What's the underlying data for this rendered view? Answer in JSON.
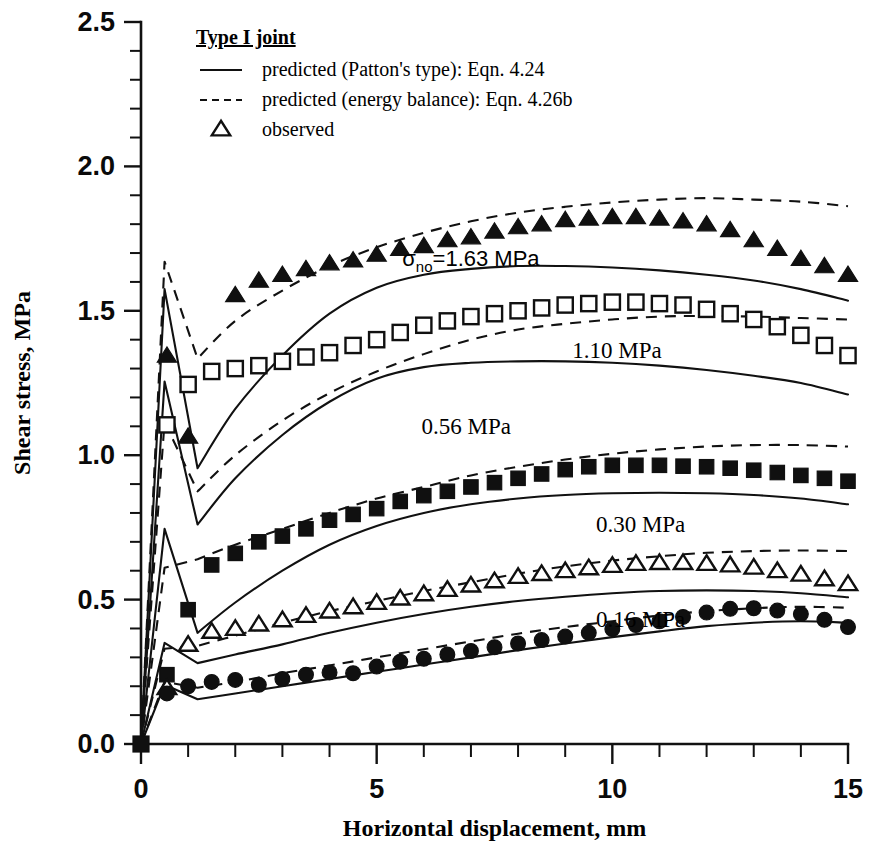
{
  "chart_data": {
    "type": "line",
    "title": "",
    "xlabel": "Horizontal displacement, mm",
    "ylabel": "Shear stress, MPa",
    "xlim": [
      0,
      15
    ],
    "ylim": [
      0.0,
      2.5
    ],
    "grid": false,
    "xticks": [
      0,
      5,
      10,
      15
    ],
    "xticklabels": [
      "0",
      "5",
      "10",
      "15"
    ],
    "xminor_step": 1,
    "yticks": [
      0.0,
      0.5,
      1.0,
      1.5,
      2.0,
      2.5
    ],
    "yticklabels": [
      "0.0",
      "0.5",
      "1.0",
      "1.5",
      "2.0",
      "2.5"
    ],
    "yminor_step": 0.1,
    "legend": {
      "position": "top-left-inside",
      "title": "Type I joint",
      "entries": [
        {
          "marker": "line-solid",
          "label": "predicted (Patton's type): Eqn. 4.24"
        },
        {
          "marker": "line-dashed",
          "label": "predicted (energy balance): Eqn. 4.26b"
        },
        {
          "marker": "triangle-open",
          "label": "observed"
        }
      ]
    },
    "annotations": [
      {
        "text": "σno=1.63 MPa",
        "sigma": "σ",
        "subscript": "no",
        "rest": "=1.63 MPa",
        "x": 7.0,
        "y": 1.655,
        "font": "sans"
      },
      {
        "text": "1.10 MPa",
        "x": 10.1,
        "y": 1.335,
        "font": "serif"
      },
      {
        "text": "0.56 MPa",
        "x": 6.9,
        "y": 1.075,
        "font": "serif"
      },
      {
        "text": "0.30 MPa",
        "x": 10.6,
        "y": 0.735,
        "font": "serif"
      },
      {
        "text": "0.16 MPa",
        "x": 10.6,
        "y": 0.405,
        "font": "serif"
      }
    ],
    "series": [
      {
        "name": "1.63 MPa",
        "normal_stress": 1.63,
        "marker": "triangle-filled",
        "observed": {
          "x": [
            2.0,
            2.5,
            3.0,
            3.5,
            4.0,
            4.5,
            5.0,
            5.5,
            6.0,
            6.5,
            7.0,
            7.5,
            8.0,
            8.5,
            9.0,
            9.5,
            10.0,
            10.5,
            11.0,
            11.5,
            12.0,
            12.5,
            13.0,
            13.5,
            14.0,
            14.5,
            15.0
          ],
          "y": [
            1.555,
            1.605,
            1.625,
            1.645,
            1.665,
            1.675,
            1.695,
            1.715,
            1.725,
            1.745,
            1.755,
            1.775,
            1.79,
            1.8,
            1.815,
            1.82,
            1.825,
            1.825,
            1.82,
            1.81,
            1.8,
            1.78,
            1.745,
            1.715,
            1.68,
            1.655,
            1.625
          ]
        },
        "extra_observed": {
          "x": [
            0.55,
            1.0
          ],
          "y": [
            1.345,
            1.065
          ]
        },
        "predicted_patton": {
          "x": [
            0.0,
            0.5,
            1.2,
            2.0,
            3.0,
            4.0,
            5.0,
            6.0,
            7.0,
            8.0,
            9.0,
            10.0,
            11.0,
            12.0,
            13.0,
            14.0,
            15.0
          ],
          "y": [
            0.0,
            1.575,
            0.955,
            1.16,
            1.345,
            1.49,
            1.58,
            1.625,
            1.645,
            1.655,
            1.655,
            1.65,
            1.64,
            1.625,
            1.605,
            1.575,
            1.535
          ]
        },
        "predicted_energy": {
          "x": [
            0.0,
            0.5,
            1.2,
            2.0,
            3.0,
            4.0,
            5.0,
            6.0,
            7.0,
            8.0,
            9.0,
            10.0,
            11.0,
            12.0,
            13.0,
            14.0,
            15.0
          ],
          "y": [
            0.0,
            1.67,
            1.335,
            1.465,
            1.57,
            1.655,
            1.72,
            1.77,
            1.81,
            1.84,
            1.86,
            1.875,
            1.885,
            1.89,
            1.885,
            1.878,
            1.862
          ]
        }
      },
      {
        "name": "1.10 MPa",
        "normal_stress": 1.1,
        "marker": "square-open",
        "observed": {
          "x": [
            0.55,
            1.0,
            1.5,
            2.0,
            2.5,
            3.0,
            3.5,
            4.0,
            4.5,
            5.0,
            5.5,
            6.0,
            6.5,
            7.0,
            7.5,
            8.0,
            8.5,
            9.0,
            9.5,
            10.0,
            10.5,
            11.0,
            11.5,
            12.0,
            12.5,
            13.0,
            13.5,
            14.0,
            14.5,
            15.0
          ],
          "y": [
            1.105,
            1.245,
            1.29,
            1.3,
            1.31,
            1.325,
            1.34,
            1.355,
            1.38,
            1.4,
            1.425,
            1.45,
            1.465,
            1.48,
            1.49,
            1.5,
            1.51,
            1.52,
            1.525,
            1.53,
            1.53,
            1.525,
            1.52,
            1.505,
            1.49,
            1.47,
            1.445,
            1.415,
            1.38,
            1.345
          ]
        },
        "predicted_patton": {
          "x": [
            0.0,
            0.5,
            1.2,
            2.0,
            3.0,
            4.0,
            5.0,
            6.0,
            7.0,
            8.0,
            9.0,
            10.0,
            11.0,
            12.0,
            13.0,
            14.0,
            15.0
          ],
          "y": [
            0.0,
            1.255,
            0.76,
            0.92,
            1.07,
            1.185,
            1.265,
            1.305,
            1.32,
            1.325,
            1.325,
            1.32,
            1.31,
            1.295,
            1.275,
            1.25,
            1.21
          ]
        },
        "predicted_energy": {
          "x": [
            0.0,
            0.5,
            1.2,
            2.0,
            3.0,
            4.0,
            5.0,
            6.0,
            7.0,
            8.0,
            9.0,
            10.0,
            11.0,
            12.0,
            13.0,
            14.0,
            15.0
          ],
          "y": [
            0.0,
            1.115,
            0.875,
            1.0,
            1.12,
            1.215,
            1.29,
            1.35,
            1.4,
            1.435,
            1.455,
            1.47,
            1.48,
            1.482,
            1.48,
            1.475,
            1.47
          ]
        }
      },
      {
        "name": "0.56 MPa",
        "normal_stress": 0.56,
        "marker": "square-filled",
        "observed": {
          "x": [
            0.55,
            1.0,
            1.5,
            2.0,
            2.5,
            3.0,
            3.5,
            4.0,
            4.5,
            5.0,
            5.5,
            6.0,
            6.5,
            7.0,
            7.5,
            8.0,
            8.5,
            9.0,
            9.5,
            10.0,
            10.5,
            11.0,
            11.5,
            12.0,
            12.5,
            13.0,
            13.5,
            14.0,
            14.5,
            15.0
          ],
          "y": [
            0.24,
            0.465,
            0.62,
            0.66,
            0.7,
            0.72,
            0.745,
            0.775,
            0.795,
            0.815,
            0.84,
            0.86,
            0.875,
            0.89,
            0.905,
            0.92,
            0.935,
            0.95,
            0.96,
            0.965,
            0.965,
            0.965,
            0.962,
            0.96,
            0.955,
            0.948,
            0.94,
            0.93,
            0.92,
            0.91
          ]
        },
        "predicted_patton": {
          "x": [
            0.0,
            0.5,
            1.2,
            2.0,
            3.0,
            4.0,
            5.0,
            6.0,
            7.0,
            8.0,
            9.0,
            10.0,
            11.0,
            12.0,
            13.0,
            14.0,
            15.0
          ],
          "y": [
            0.0,
            0.745,
            0.385,
            0.49,
            0.6,
            0.69,
            0.755,
            0.8,
            0.83,
            0.85,
            0.862,
            0.868,
            0.87,
            0.868,
            0.862,
            0.85,
            0.83
          ]
        },
        "predicted_energy": {
          "x": [
            0.0,
            0.5,
            1.2,
            2.0,
            3.0,
            4.0,
            5.0,
            6.0,
            7.0,
            8.0,
            9.0,
            10.0,
            11.0,
            12.0,
            13.0,
            14.0,
            15.0
          ],
          "y": [
            0.0,
            0.61,
            0.64,
            0.69,
            0.745,
            0.8,
            0.85,
            0.89,
            0.93,
            0.96,
            0.985,
            1.005,
            1.02,
            1.03,
            1.035,
            1.035,
            1.03
          ]
        }
      },
      {
        "name": "0.30 MPa",
        "normal_stress": 0.3,
        "marker": "triangle-open",
        "observed": {
          "x": [
            0.55,
            1.0,
            1.5,
            2.0,
            2.5,
            3.0,
            3.5,
            4.0,
            4.5,
            5.0,
            5.5,
            6.0,
            6.5,
            7.0,
            7.5,
            8.0,
            8.5,
            9.0,
            9.5,
            10.0,
            10.5,
            11.0,
            11.5,
            12.0,
            12.5,
            13.0,
            13.5,
            14.0,
            14.5,
            15.0
          ],
          "y": [
            0.195,
            0.345,
            0.39,
            0.4,
            0.415,
            0.43,
            0.445,
            0.46,
            0.475,
            0.49,
            0.505,
            0.52,
            0.535,
            0.55,
            0.565,
            0.58,
            0.59,
            0.6,
            0.61,
            0.618,
            0.625,
            0.628,
            0.628,
            0.625,
            0.62,
            0.612,
            0.6,
            0.588,
            0.572,
            0.555
          ]
        },
        "predicted_patton": {
          "x": [
            0.0,
            0.5,
            1.2,
            2.0,
            3.0,
            4.0,
            5.0,
            6.0,
            7.0,
            8.0,
            9.0,
            10.0,
            11.0,
            12.0,
            13.0,
            14.0,
            15.0
          ],
          "y": [
            0.0,
            0.35,
            0.28,
            0.31,
            0.345,
            0.385,
            0.42,
            0.45,
            0.475,
            0.495,
            0.51,
            0.522,
            0.53,
            0.532,
            0.53,
            0.522,
            0.508
          ]
        },
        "predicted_energy": {
          "x": [
            0.0,
            0.5,
            1.2,
            2.0,
            3.0,
            4.0,
            5.0,
            6.0,
            7.0,
            8.0,
            9.0,
            10.0,
            11.0,
            12.0,
            13.0,
            14.0,
            15.0
          ],
          "y": [
            0.0,
            0.33,
            0.34,
            0.375,
            0.42,
            0.46,
            0.495,
            0.53,
            0.56,
            0.59,
            0.615,
            0.635,
            0.65,
            0.662,
            0.668,
            0.67,
            0.668
          ]
        }
      },
      {
        "name": "0.16 MPa",
        "normal_stress": 0.16,
        "marker": "circle-filled",
        "observed": {
          "x": [
            0.55,
            1.0,
            1.5,
            2.0,
            2.5,
            3.0,
            3.5,
            4.0,
            4.5,
            5.0,
            5.5,
            6.0,
            6.5,
            7.0,
            7.5,
            8.0,
            8.5,
            9.0,
            9.5,
            10.0,
            10.5,
            11.0,
            11.5,
            12.0,
            12.5,
            13.0,
            13.5,
            14.0,
            14.5,
            15.0
          ],
          "y": [
            0.175,
            0.2,
            0.215,
            0.222,
            0.205,
            0.225,
            0.24,
            0.248,
            0.245,
            0.268,
            0.285,
            0.295,
            0.31,
            0.322,
            0.335,
            0.348,
            0.36,
            0.372,
            0.385,
            0.398,
            0.412,
            0.425,
            0.44,
            0.455,
            0.468,
            0.47,
            0.462,
            0.45,
            0.43,
            0.405
          ]
        },
        "predicted_patton": {
          "x": [
            0.0,
            0.5,
            1.2,
            2.0,
            3.0,
            4.0,
            5.0,
            6.0,
            7.0,
            8.0,
            9.0,
            10.0,
            11.0,
            12.0,
            13.0,
            14.0,
            15.0
          ],
          "y": [
            0.0,
            0.205,
            0.155,
            0.175,
            0.2,
            0.225,
            0.25,
            0.275,
            0.3,
            0.325,
            0.348,
            0.37,
            0.39,
            0.408,
            0.42,
            0.425,
            0.42
          ]
        },
        "predicted_energy": {
          "x": [
            0.0,
            0.5,
            1.2,
            2.0,
            3.0,
            4.0,
            5.0,
            6.0,
            7.0,
            8.0,
            9.0,
            10.0,
            11.0,
            12.0,
            13.0,
            14.0,
            15.0
          ],
          "y": [
            0.0,
            0.215,
            0.195,
            0.215,
            0.245,
            0.272,
            0.3,
            0.328,
            0.355,
            0.382,
            0.405,
            0.425,
            0.445,
            0.46,
            0.47,
            0.475,
            0.472
          ]
        }
      }
    ]
  }
}
